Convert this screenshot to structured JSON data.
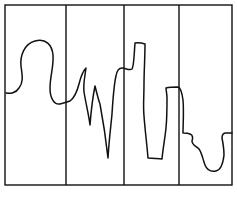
{
  "figure": {
    "width": 237,
    "height": 199,
    "background": "#ffffff",
    "stroke_color": "#111111",
    "frame": {
      "x": 5,
      "y": 5,
      "width": 227,
      "height": 180,
      "stroke_width": 1.4
    },
    "panel_dividers_x": [
      66,
      124,
      179
    ],
    "panels": 4,
    "curve": {
      "stroke_width": 1.5,
      "path": "M 6 93 C 10 94, 16 93, 19 88 C 24 82, 22 74, 21 66 C 20 56, 24 44, 35 41 C 46 38, 52 45, 53 55 C 54 66, 50 76, 50 88 C 50 98, 54 105, 60 104 C 64 103, 67 102, 70 101 C 74 98, 77 92, 79 84 C 81 76, 84 70, 86 68 C 85 76, 83 84, 84 92 C 86 104, 89 116, 90 125 C 91 112, 93 96, 95 86 C 97 94, 99 102, 100 104 C 103 120, 106 140, 108 158 C 109 140, 111 125, 112 114 C 113 98, 114 84, 116 76 C 117 70, 119 68, 122 68 C 126 68, 129 71, 132 69 C 134 66, 134 55, 135 43 C 139 42, 142 43, 145 44 C 145 58, 144 72, 144 84 C 144 98, 143 106, 144 116 C 145 130, 147 145, 148 158 C 153 158, 158 159, 162 159 C 163 148, 165 138, 166 128 C 167 118, 167 108, 167 98 C 167 94, 166 90, 166 88 C 170 87, 174 87, 178 87 C 181 88, 182 92, 183 100 C 184 112, 183 124, 183 133 C 186 133, 188 133, 190 134 C 193 135, 193 138, 192 141 C 192 145, 196 146, 199 149 C 202 153, 203 160, 205 165 C 207 170, 211 172, 216 171 C 221 170, 223 164, 224 155 C 224 148, 223 143, 222 138 C 222 135, 223 133, 226 133 L 232 133"
    }
  }
}
